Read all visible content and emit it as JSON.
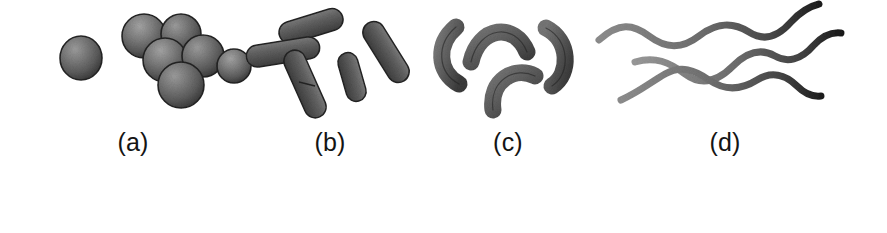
{
  "figure": {
    "background_color": "#ffffff",
    "ink_color": "#141414",
    "cell_fill_mid": "#6a6a6a",
    "cell_fill_dark": "#3a3a3a",
    "cell_fill_light": "#a9a9a9",
    "cell_outline": "#262626",
    "panels": [
      {
        "id": "a",
        "label": "(a)",
        "morphology": "cocci",
        "description": "spherical cells, one single coccus and a grape-like cluster of six",
        "cell_count": 7
      },
      {
        "id": "b",
        "label": "(b)",
        "morphology": "bacilli",
        "description": "rod-shaped cells at varied angles, one dividing",
        "cell_count": 5
      },
      {
        "id": "c",
        "label": "(c)",
        "morphology": "vibrios",
        "description": "curved comma-shaped rods arranged radially",
        "cell_count": 4
      },
      {
        "id": "d",
        "label": "(d)",
        "morphology": "spirochetes",
        "description": "long wavy helical filaments with tapered dark ends",
        "cell_count": 3
      }
    ]
  }
}
